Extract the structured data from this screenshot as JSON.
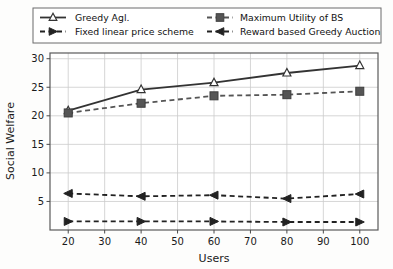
{
  "chart_data": {
    "type": "line",
    "title": "",
    "xlabel": "Users",
    "ylabel": "Social Welfare",
    "x": [
      20,
      40,
      60,
      80,
      100
    ],
    "xlim": [
      15,
      105
    ],
    "ylim": [
      0,
      31
    ],
    "xticks": [
      "20",
      "30",
      "40",
      "50",
      "60",
      "70",
      "80",
      "90",
      "100"
    ],
    "xtick_values": [
      20,
      30,
      40,
      50,
      60,
      70,
      80,
      90,
      100
    ],
    "yticks": [
      "5",
      "10",
      "15",
      "20",
      "25",
      "30"
    ],
    "ytick_values": [
      5,
      10,
      15,
      20,
      25,
      30
    ],
    "grid": true,
    "legend_position": "above-plot",
    "series": [
      {
        "name": "Greedy Agl.",
        "values": [
          20.9,
          24.6,
          25.8,
          27.5,
          28.8
        ],
        "marker": "triangle-up-open",
        "linestyle": "solid",
        "color": "#333333"
      },
      {
        "name": "Maximum Utility of BS",
        "values": [
          20.5,
          22.2,
          23.5,
          23.7,
          24.3
        ],
        "marker": "square-filled",
        "linestyle": "dashed",
        "color": "#555555"
      },
      {
        "name": "Fixed linear price scheme",
        "values": [
          1.5,
          1.5,
          1.5,
          1.4,
          1.4
        ],
        "marker": "triangle-right-filled",
        "linestyle": "dashed",
        "color": "#222222"
      },
      {
        "name": "Reward based Greedy Auction",
        "values": [
          6.4,
          5.9,
          6.1,
          5.5,
          6.3
        ],
        "marker": "triangle-left-filled",
        "linestyle": "dashed",
        "color": "#222222"
      }
    ]
  },
  "legend": {
    "entries": [
      {
        "label": "Greedy Agl."
      },
      {
        "label": "Maximum Utility of BS"
      },
      {
        "label": "Fixed linear price scheme"
      },
      {
        "label": "Reward based Greedy Auction"
      }
    ]
  },
  "axes": {
    "x_title": "Users",
    "y_title": "Social Welfare"
  }
}
